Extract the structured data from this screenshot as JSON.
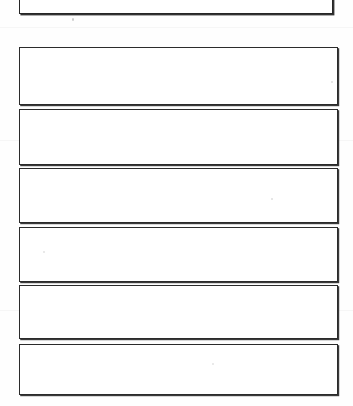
{
  "document": {
    "type": "scanned-worksheet-page",
    "page_background": "#ffffff",
    "ink_color": "#262626"
  },
  "heading": {
    "number": "5.",
    "title": "Extension",
    "full_text": "5. Extension",
    "clipped_at_top": true
  },
  "answer_boxes": [
    {
      "id": 1,
      "label": "",
      "content": ""
    },
    {
      "id": 2,
      "label": "",
      "content": ""
    },
    {
      "id": 3,
      "label": "",
      "content": ""
    },
    {
      "id": 4,
      "label": "",
      "content": ""
    },
    {
      "id": 5,
      "label": "",
      "content": ""
    },
    {
      "id": 6,
      "label": "",
      "content": ""
    }
  ],
  "artifacts": {
    "specks": 5,
    "note": "faint scanner dust marks on paper"
  }
}
